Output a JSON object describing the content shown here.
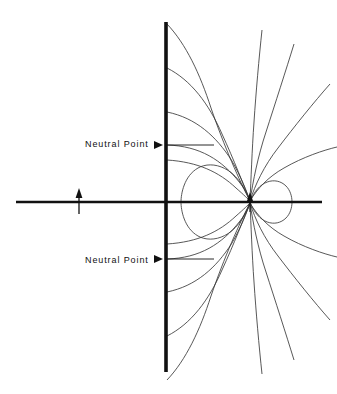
{
  "figure": {
    "type": "field-line-diagram",
    "width": 337,
    "height": 394,
    "background_color": "#ffffff",
    "line_color": "#111111",
    "curve_color": "#3a3a3a"
  },
  "labels": {
    "neutral_point_upper": "Neutral Point",
    "neutral_point_lower": "Neutral Point"
  },
  "annotations": {
    "upper_arrow_name": "arrowhead-right",
    "lower_arrow_name": "arrowhead-right",
    "dipole_arrow_name": "dipole-arrow-up"
  },
  "geometry": {
    "axis_y": 202,
    "axis_x_start": 16,
    "axis_x_end": 322,
    "plane_x": 166,
    "plane_y_start": 22,
    "plane_y_end": 372,
    "dipole_x": 250,
    "dipole_y": 202,
    "source_arrow_x": 79,
    "neutral_point_upper_y": 145,
    "neutral_point_lower_y": 259
  }
}
